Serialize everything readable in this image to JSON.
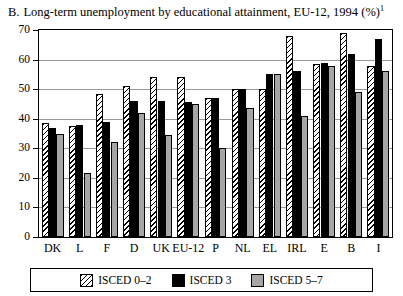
{
  "title": {
    "letter": "B.",
    "text": "Long-term unemployment by educational attainment, EU-12, 1994 (%)",
    "footnote_marker": "1"
  },
  "chart_data": {
    "type": "bar",
    "title": "Long-term unemployment by educational attainment, EU-12, 1994 (%)",
    "xlabel": "",
    "ylabel": "",
    "ylim": [
      0,
      70
    ],
    "yticks": [
      0,
      10,
      20,
      30,
      40,
      50,
      60,
      70
    ],
    "grid": true,
    "legend_position": "bottom",
    "categories": [
      "DK",
      "L",
      "F",
      "D",
      "UK",
      "EU-12",
      "P",
      "NL",
      "EL",
      "IRL",
      "E",
      "B",
      "I"
    ],
    "series": [
      {
        "name": "ISCED 0–2",
        "pattern": "diagonal-hatch",
        "values": [
          38.5,
          37.5,
          48.5,
          51,
          54,
          54,
          47,
          50,
          50,
          68,
          58.5,
          69,
          58
        ]
      },
      {
        "name": "ISCED 3",
        "pattern": "solid-black",
        "values": [
          37,
          38,
          39,
          46,
          46,
          45.5,
          47,
          50,
          55,
          56,
          59,
          62,
          67
        ]
      },
      {
        "name": "ISCED 5–7",
        "pattern": "solid-gray",
        "values": [
          35,
          21.5,
          32,
          42,
          34.5,
          45,
          30,
          43.5,
          55,
          41,
          58,
          49,
          56
        ]
      }
    ]
  },
  "legend": {
    "items": [
      {
        "label": "ISCED 0–2",
        "swatch": "isced02"
      },
      {
        "label": "ISCED 3",
        "swatch": "isced3"
      },
      {
        "label": "ISCED 5–7",
        "swatch": "isced57"
      }
    ]
  },
  "colors": {
    "black": "#000000",
    "gray": "#a6a6a6",
    "gridline": "#9a9a9a",
    "background": "#ffffff"
  }
}
